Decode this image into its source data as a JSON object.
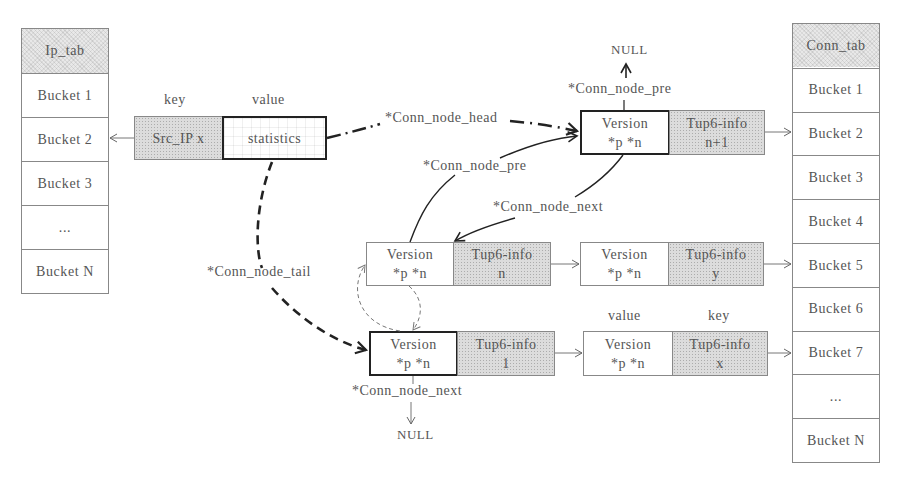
{
  "ip_tab": {
    "title": "Ip_tab",
    "buckets": [
      "Bucket 1",
      "Bucket 2",
      "Bucket 3",
      "...",
      "Bucket N"
    ]
  },
  "conn_tab": {
    "title": "Conn_tab",
    "buckets": [
      "Bucket 1",
      "Bucket 2",
      "Bucket 3",
      "Bucket 4",
      "Bucket 5",
      "Bucket 6",
      "Bucket 7",
      "...",
      "Bucket N"
    ]
  },
  "ip_entry": {
    "key_label": "key",
    "value_label": "value",
    "key": "Src_IP x",
    "value": "statistics"
  },
  "nodes": {
    "n_plus_1": {
      "version": "Version",
      "ptrs": "*p *n",
      "tup": "Tup6-info",
      "id": "n+1"
    },
    "n": {
      "version": "Version",
      "ptrs": "*p *n",
      "tup": "Tup6-info",
      "id": "n"
    },
    "y": {
      "version": "Version",
      "ptrs": "*p *n",
      "tup": "Tup6-info",
      "id": "y"
    },
    "one": {
      "version": "Version",
      "ptrs": "*p *n",
      "tup": "Tup6-info",
      "id": "1"
    },
    "x": {
      "version": "Version",
      "ptrs": "*p *n",
      "tup": "Tup6-info",
      "id": "x",
      "value_label": "value",
      "key_label": "key"
    }
  },
  "pointer_labels": {
    "head": "*Conn_node_head",
    "tail": "*Conn_node_tail",
    "pre_top": "*Conn_node_pre",
    "pre_mid": "*Conn_node_pre",
    "next_mid": "*Conn_node_next",
    "next_bottom": "*Conn_node_next"
  },
  "null_labels": {
    "top": "NULL",
    "bottom": "NULL"
  }
}
